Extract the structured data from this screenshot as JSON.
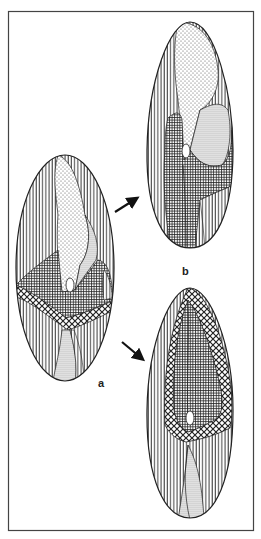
{
  "figure": {
    "labels": {
      "a": "a",
      "b": "b"
    },
    "panels": [
      {
        "id": "a",
        "label": "a",
        "description": "initial grain with vertical-line, stippled, grid and diamond-crosshatch zones; white hilum"
      },
      {
        "id": "b",
        "label": "b",
        "description": "elongated grain, stippled upper zones over grid center, vertical lines at sides"
      },
      {
        "id": "c",
        "label": "",
        "description": "elongated grain with diamond-crosshatch ring around dense grid core, vertical lines below, stippled streak at base"
      }
    ],
    "arrows": [
      {
        "from": "a",
        "to": "b"
      },
      {
        "from": "a",
        "to": "c"
      }
    ],
    "patterns": [
      "vertical-lines",
      "fine-dots",
      "dense-dots",
      "grid",
      "diamond-crosshatch",
      "white-hilum"
    ],
    "colors": {
      "ink": "#222222",
      "frame": "#444444",
      "background": "#ffffff"
    }
  }
}
